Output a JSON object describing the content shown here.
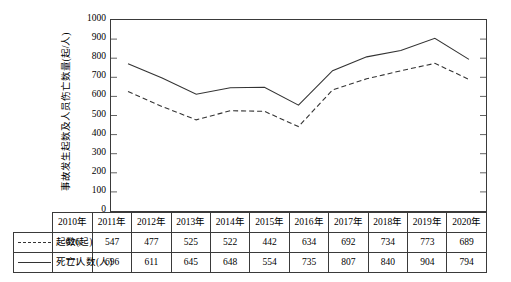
{
  "chart_data": {
    "type": "line",
    "title": "",
    "xlabel": "",
    "ylabel": "事故发生起数及人员伤亡数量(起/人)",
    "categories": [
      "2010年",
      "2011年",
      "2012年",
      "2013年",
      "2014年",
      "2015年",
      "2016年",
      "2017年",
      "2018年",
      "2019年",
      "2020年"
    ],
    "series": [
      {
        "name": "起数(起)",
        "style": "dashed",
        "color": "#333333",
        "values": [
          626,
          547,
          477,
          525,
          522,
          442,
          634,
          692,
          734,
          773,
          689
        ]
      },
      {
        "name": "死亡人数(人)",
        "style": "solid",
        "color": "#333333",
        "values": [
          771,
          696,
          611,
          645,
          648,
          554,
          735,
          807,
          840,
          904,
          794
        ]
      }
    ],
    "ylim": [
      0,
      1000
    ],
    "ytick_step": 100,
    "yticks": [
      "1000",
      "900",
      "800",
      "700",
      "600",
      "500",
      "400",
      "300",
      "200",
      "100",
      "0"
    ],
    "grid": false,
    "legend_position": "table-left-column"
  },
  "table": {
    "corner_label": "",
    "rows": [
      {
        "legend_label": "起数(起)",
        "sample": "dashed-line",
        "values": [
          "626",
          "547",
          "477",
          "525",
          "522",
          "442",
          "634",
          "692",
          "734",
          "773",
          "689"
        ]
      },
      {
        "legend_label": "死亡人数(人)",
        "sample": "solid-line",
        "values": [
          "771",
          "696",
          "611",
          "645",
          "648",
          "554",
          "735",
          "807",
          "840",
          "904",
          "794"
        ]
      }
    ]
  }
}
